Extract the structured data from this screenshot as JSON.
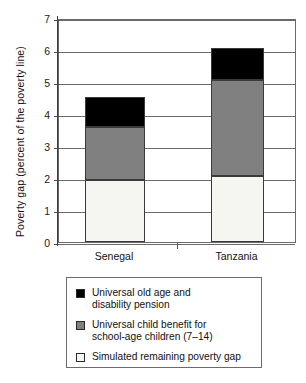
{
  "chart_data": {
    "type": "bar",
    "subtype": "stacked-bar-vertical",
    "title": "",
    "xlabel": "",
    "ylabel": "Poverty gap (percent of the poverty line)",
    "categories": [
      "Senegal",
      "Tanzania"
    ],
    "ylim": [
      0,
      7
    ],
    "ytick_labels": [
      "0",
      "1",
      "2",
      "3",
      "4",
      "5",
      "6",
      "7"
    ],
    "ytick_values": [
      0,
      1,
      2,
      3,
      4,
      5,
      6,
      7
    ],
    "grid": true,
    "grid_axis": "y",
    "legend_position": "below-plot",
    "stack_order_bottom_to_top": [
      "Simulated remaining poverty gap",
      "Universal child benefit for school-age children (7–14)",
      "Universal old age and disability pension"
    ],
    "series": [
      {
        "name": "Universal old age and disability pension",
        "color": "#000000",
        "values": [
          0.92,
          1.0
        ]
      },
      {
        "name": "Universal child benefit for school-age children (7–14)",
        "color": "#808080",
        "values": [
          1.65,
          3.0
        ]
      },
      {
        "name": "Simulated remaining poverty gap",
        "color": "#f5f5f2",
        "values": [
          1.95,
          2.05
        ]
      }
    ],
    "cumulative_tops": {
      "Senegal": [
        1.95,
        3.6,
        4.52
      ],
      "Tanzania": [
        2.05,
        5.05,
        6.05
      ]
    },
    "totals": [
      4.52,
      6.05
    ]
  },
  "legend": {
    "items": [
      {
        "swatch": "black-swatch",
        "line1": "Universal old age and",
        "line2": "disability pension"
      },
      {
        "swatch": "gray-swatch",
        "line1": "Universal child benefit for",
        "line2": "school-age children (7–14)"
      },
      {
        "swatch": "white-swatch",
        "line1": "Simulated remaining poverty gap",
        "line2": ""
      }
    ]
  },
  "colors": {
    "black": "#000000",
    "gray": "#808080",
    "white": "#f5f5f2",
    "axis": "#3a3a3a",
    "grid": "#6a6a6a"
  }
}
